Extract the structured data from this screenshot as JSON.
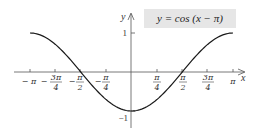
{
  "chart_data": {
    "type": "line",
    "title": "y = cos (x − π)",
    "xlabel": "x",
    "ylabel": "y",
    "xlim": [
      -3.14159,
      3.14159
    ],
    "ylim": [
      -1,
      1
    ],
    "grid": false,
    "legend": "none",
    "x_ticks": [
      {
        "value": -3.14159,
        "label_num": "",
        "label_den": "",
        "label": "− π"
      },
      {
        "value": -2.35619,
        "label_num": "3π",
        "label_den": "4",
        "label": "−3π/4"
      },
      {
        "value": -1.5708,
        "label_num": "π",
        "label_den": "2",
        "label": "−π/2"
      },
      {
        "value": -0.7854,
        "label_num": "π",
        "label_den": "4",
        "label": "−π/4"
      },
      {
        "value": 0.7854,
        "label_num": "π",
        "label_den": "4",
        "label": "π/4"
      },
      {
        "value": 1.5708,
        "label_num": "π",
        "label_den": "2",
        "label": "π/2"
      },
      {
        "value": 2.35619,
        "label_num": "3π",
        "label_den": "4",
        "label": "3π/4"
      },
      {
        "value": 3.14159,
        "label_num": "",
        "label_den": "",
        "label": "π"
      }
    ],
    "y_ticks": [
      {
        "value": 1,
        "label": "1"
      },
      {
        "value": -1,
        "label": "−1"
      }
    ],
    "series": [
      {
        "name": "y = cos (x − π)",
        "color": "#1a1a1a",
        "x": [
          -3.14159,
          -2.35619,
          -1.5708,
          -0.7854,
          0,
          0.7854,
          1.5708,
          2.35619,
          3.14159
        ],
        "y": [
          1,
          0.7071,
          0,
          -0.7071,
          -1,
          -0.7071,
          0,
          0.7071,
          1
        ]
      }
    ],
    "annotation": {
      "text": "y = cos (x − π)",
      "background": "#e6e6e6"
    }
  },
  "labels": {
    "x_axis": "x",
    "y_axis": "y",
    "neg_pi": "− π",
    "pi": "π",
    "minus": "−",
    "y_one": "1",
    "y_neg_one": "−1",
    "title": "y = cos (x − π)"
  }
}
